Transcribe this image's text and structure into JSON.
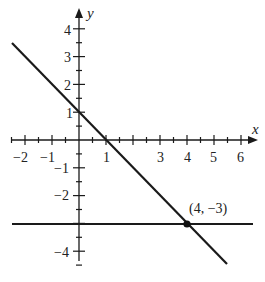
{
  "chart_data": {
    "type": "line",
    "title": "",
    "xlabel": "x",
    "ylabel": "y",
    "xlim": [
      -2.5,
      6.7
    ],
    "ylim": [
      -4.7,
      4.7
    ],
    "grid": false,
    "x_ticks": [
      -2,
      -1,
      1,
      3,
      4,
      5,
      6
    ],
    "y_ticks": [
      4,
      3,
      2,
      1,
      -1,
      -2,
      -4
    ],
    "tick_labels": {
      "x": [
        "−2",
        "−1",
        "1",
        "3",
        "4",
        "5",
        "6"
      ],
      "y": [
        "4",
        "3",
        "2",
        "1",
        "−1",
        "−2",
        "−4"
      ]
    },
    "series": [
      {
        "name": "line y = -x + 1",
        "points": [
          [
            -2.5,
            3.5
          ],
          [
            5.5,
            -4.5
          ]
        ]
      },
      {
        "name": "line y = -3",
        "points": [
          [
            -2.5,
            -3
          ],
          [
            6.4,
            -3
          ]
        ]
      }
    ],
    "annotations": [
      {
        "text": "(4, −3)",
        "x": 4,
        "y": -3,
        "marker": "filled-dot"
      }
    ]
  }
}
